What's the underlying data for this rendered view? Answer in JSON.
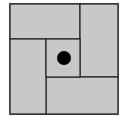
{
  "diagram": {
    "colors": {
      "fill": "#c8c8c8",
      "stroke": "#222222",
      "dot": "#000000",
      "background": "#ffffff"
    },
    "outer": {
      "x": 10,
      "y": 4,
      "w": 108,
      "h": 110
    },
    "rects": [
      {
        "name": "top-left-rect",
        "x": 10,
        "y": 4,
        "w": 70,
        "h": 35
      },
      {
        "name": "right-rect",
        "x": 80,
        "y": 4,
        "w": 38,
        "h": 73
      },
      {
        "name": "bottom-right-rect",
        "x": 46,
        "y": 77,
        "w": 72,
        "h": 37
      },
      {
        "name": "left-rect",
        "x": 10,
        "y": 39,
        "w": 36,
        "h": 75
      },
      {
        "name": "center-square",
        "x": 46,
        "y": 39,
        "w": 34,
        "h": 38
      }
    ],
    "dot": {
      "cx": 64,
      "cy": 58,
      "r": 7
    }
  }
}
